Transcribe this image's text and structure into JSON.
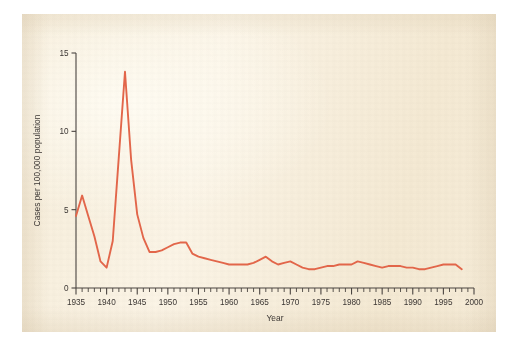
{
  "chart_data": {
    "type": "line",
    "title": "",
    "xlabel": "Year",
    "ylabel": "Cases per 100,000 population",
    "xlim": [
      1935,
      2000
    ],
    "ylim": [
      0,
      15
    ],
    "xticks": [
      1935,
      1940,
      1945,
      1950,
      1955,
      1960,
      1965,
      1970,
      1975,
      1980,
      1985,
      1990,
      1995,
      2000
    ],
    "xticklabels": [
      "1935",
      "1940",
      "1945",
      "1950",
      "1955",
      "1960",
      "1965",
      "1970",
      "1975",
      "1980",
      "1985",
      "1990",
      "1995",
      "2000"
    ],
    "yticks": [
      0,
      5,
      10,
      15
    ],
    "yticklabels": [
      "0",
      "5",
      "10",
      "15"
    ],
    "minor_tick_interval": 1,
    "grid": false,
    "legend": false,
    "series": [
      {
        "name": "Cases per 100,000 population",
        "color": "#e2664a",
        "x": [
          1935,
          1936,
          1937,
          1938,
          1939,
          1940,
          1941,
          1942,
          1943,
          1944,
          1945,
          1946,
          1947,
          1948,
          1949,
          1950,
          1951,
          1952,
          1953,
          1954,
          1955,
          1956,
          1957,
          1958,
          1959,
          1960,
          1961,
          1962,
          1963,
          1964,
          1965,
          1966,
          1967,
          1968,
          1969,
          1970,
          1971,
          1972,
          1973,
          1974,
          1975,
          1976,
          1977,
          1978,
          1979,
          1980,
          1981,
          1982,
          1983,
          1984,
          1985,
          1986,
          1987,
          1988,
          1989,
          1990,
          1991,
          1992,
          1993,
          1994,
          1995,
          1996,
          1997,
          1998
        ],
        "y": [
          4.6,
          5.9,
          4.6,
          3.3,
          1.7,
          1.3,
          3.0,
          8.4,
          13.8,
          8.2,
          4.7,
          3.2,
          2.3,
          2.3,
          2.4,
          2.6,
          2.8,
          2.9,
          2.9,
          2.2,
          2.0,
          1.9,
          1.8,
          1.7,
          1.6,
          1.5,
          1.5,
          1.5,
          1.5,
          1.6,
          1.8,
          2.0,
          1.7,
          1.5,
          1.6,
          1.7,
          1.5,
          1.3,
          1.2,
          1.2,
          1.3,
          1.4,
          1.4,
          1.5,
          1.5,
          1.5,
          1.7,
          1.6,
          1.5,
          1.4,
          1.3,
          1.4,
          1.4,
          1.4,
          1.3,
          1.3,
          1.2,
          1.2,
          1.3,
          1.4,
          1.5,
          1.5,
          1.5,
          1.2
        ]
      }
    ],
    "annotations": []
  },
  "axes": {
    "y_axis_title": "Cases per 100,000 population",
    "x_axis_title": "Year",
    "y_tick_0": "0",
    "y_tick_5": "5",
    "y_tick_10": "10",
    "y_tick_15": "15"
  },
  "colors": {
    "series": "#e2664a",
    "axis": "#4a4440",
    "text": "#3b3633",
    "page": "#f7efdd",
    "canvas": "#ffffff"
  }
}
